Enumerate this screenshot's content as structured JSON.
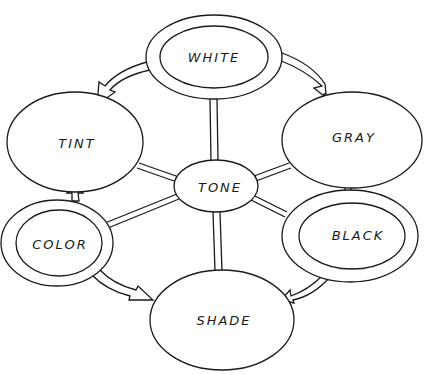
{
  "diagram": {
    "type": "concept-map",
    "colors": {
      "line": "#1a1a1a",
      "background": "#ffffff"
    },
    "nodes": [
      {
        "id": "white",
        "label": "WHITE",
        "style": "double-ellipse",
        "cx": 214,
        "cy": 57,
        "rx": 68,
        "ry": 42
      },
      {
        "id": "tint",
        "label": "TINT",
        "style": "ellipse",
        "cx": 75,
        "cy": 142,
        "rx": 68,
        "ry": 50
      },
      {
        "id": "gray",
        "label": "GRAY",
        "style": "ellipse",
        "cx": 352,
        "cy": 140,
        "rx": 70,
        "ry": 48
      },
      {
        "id": "tone",
        "label": "TONE",
        "style": "ellipse",
        "cx": 216,
        "cy": 186,
        "rx": 42,
        "ry": 26
      },
      {
        "id": "color",
        "label": "COLOR",
        "style": "double-ellipse",
        "cx": 55,
        "cy": 243,
        "rx": 56,
        "ry": 43
      },
      {
        "id": "black",
        "label": "BLACK",
        "style": "double-ellipse",
        "cx": 350,
        "cy": 236,
        "rx": 68,
        "ry": 45
      },
      {
        "id": "shade",
        "label": "SHADE",
        "style": "ellipse",
        "cx": 222,
        "cy": 320,
        "rx": 72,
        "ry": 50
      }
    ],
    "connectors": [
      {
        "from": "tone",
        "to": "white",
        "style": "double-line"
      },
      {
        "from": "tone",
        "to": "tint",
        "style": "double-line"
      },
      {
        "from": "tone",
        "to": "gray",
        "style": "double-line"
      },
      {
        "from": "tone",
        "to": "color",
        "style": "double-line"
      },
      {
        "from": "tone",
        "to": "black",
        "style": "double-line"
      },
      {
        "from": "tone",
        "to": "shade",
        "style": "double-line"
      }
    ],
    "arrows": [
      {
        "from": "white",
        "to": "tint",
        "style": "hollow-curved-arrow"
      },
      {
        "from": "white",
        "to": "gray",
        "style": "hollow-curved-arrow"
      },
      {
        "from": "color",
        "to": "tint",
        "style": "hollow-short-arrow"
      },
      {
        "from": "black",
        "to": "gray",
        "style": "hollow-short-arrow"
      },
      {
        "from": "color",
        "to": "shade",
        "style": "hollow-curved-arrow"
      },
      {
        "from": "black",
        "to": "shade",
        "style": "hollow-curved-arrow"
      }
    ]
  }
}
